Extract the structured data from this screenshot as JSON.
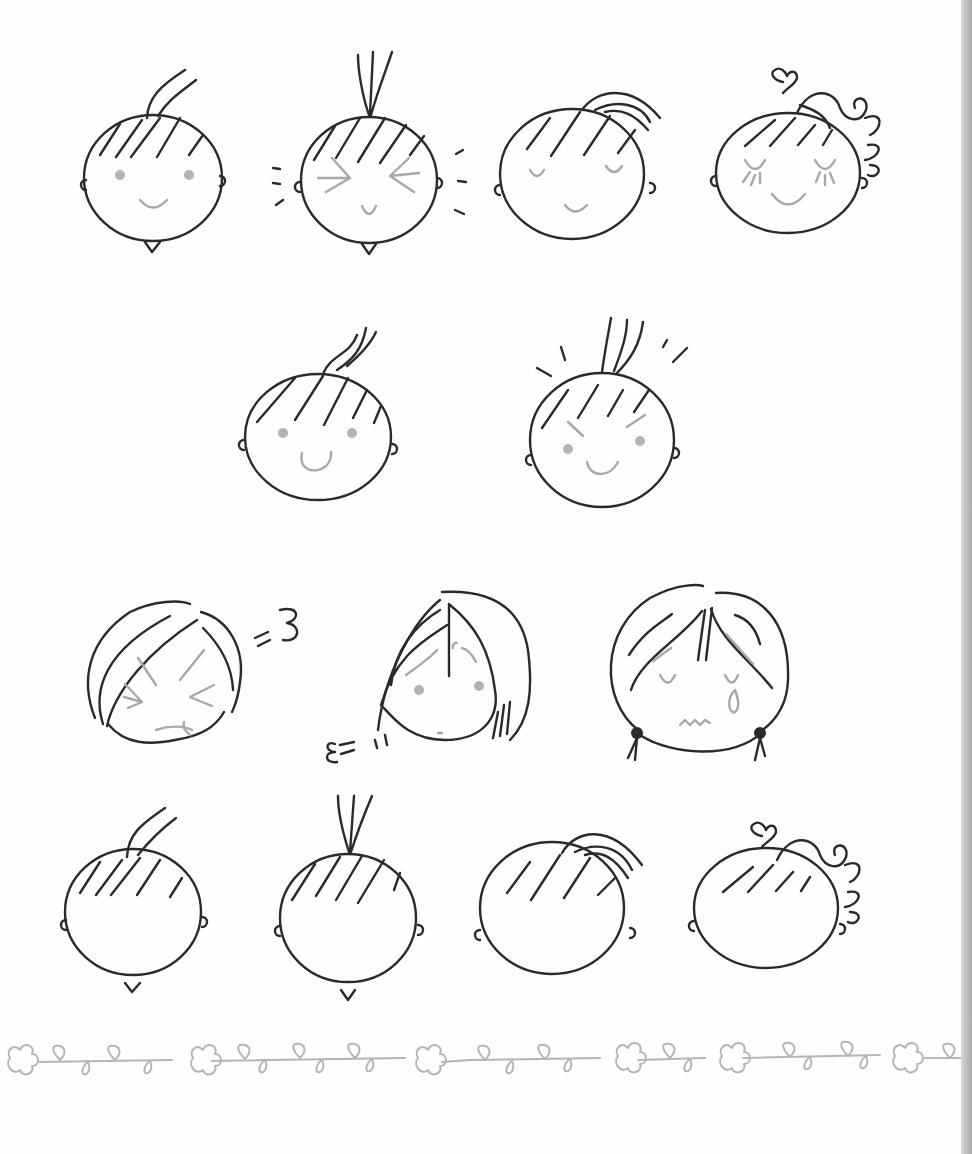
{
  "page": {
    "background": "#fefefe",
    "ink_color": "#2a2a2a",
    "accent_grey": "#a8a8a8",
    "edge_shadow": "#a9a9a9"
  },
  "illustration": {
    "subject": "hand-drawn cartoon face variations",
    "rows": [
      {
        "name": "row-1",
        "faces": [
          "side-tuft-smile",
          "top-tuft-squint",
          "ponytail-closed-eyes",
          "curly-ponytail-heart-lashes"
        ]
      },
      {
        "name": "row-2",
        "faces": [
          "side-tuft-happy",
          "top-tuft-determined"
        ]
      },
      {
        "name": "row-3",
        "faces": [
          "bob-hair-angry-huff",
          "bob-hair-worried-sigh",
          "pigtails-crying"
        ]
      },
      {
        "name": "row-4",
        "faces": [
          "side-tuft-blank",
          "top-tuft-blank",
          "ponytail-blank",
          "curly-ponytail-heart-blank"
        ]
      }
    ],
    "border": "vine-and-flower-divider"
  }
}
